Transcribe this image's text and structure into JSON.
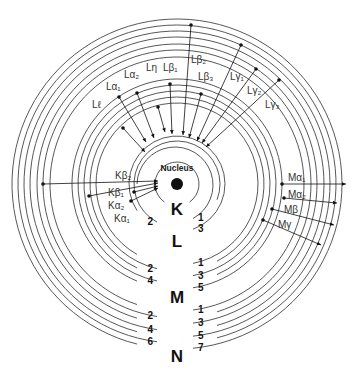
{
  "colors": {
    "line": "#111111",
    "ring": "#444444",
    "background": "#ffffff"
  },
  "center": {
    "x": 177,
    "y": 184
  },
  "nucleus": {
    "label": "Nucleus",
    "radius": 6
  },
  "shells": [
    {
      "name": "K",
      "label_pos": [
        177,
        215
      ],
      "subshells": [
        {
          "n": "",
          "r": 22,
          "side": "both"
        }
      ]
    },
    {
      "name": "L",
      "label_pos": [
        177,
        247
      ],
      "subshells": [
        {
          "n": "1",
          "r": 38,
          "side": "right"
        },
        {
          "n": "2",
          "r": 43,
          "side": "left"
        },
        {
          "n": "3",
          "r": 48,
          "side": "right"
        }
      ]
    },
    {
      "name": "M",
      "label_pos": [
        177,
        303
      ],
      "subshells": [
        {
          "n": "1",
          "r": 81,
          "side": "right"
        },
        {
          "n": "2",
          "r": 87,
          "side": "left"
        },
        {
          "n": "3",
          "r": 93,
          "side": "right"
        },
        {
          "n": "4",
          "r": 99,
          "side": "left"
        },
        {
          "n": "5",
          "r": 105,
          "side": "right"
        }
      ]
    },
    {
      "name": "N",
      "label_pos": [
        177,
        362
      ],
      "subshells": [
        {
          "n": "1",
          "r": 127,
          "side": "right"
        },
        {
          "n": "2",
          "r": 134,
          "side": "left"
        },
        {
          "n": "3",
          "r": 140,
          "side": "right"
        },
        {
          "n": "4",
          "r": 147,
          "side": "left"
        },
        {
          "n": "5",
          "r": 153,
          "side": "right"
        },
        {
          "n": "6",
          "r": 159,
          "side": "left"
        },
        {
          "n": "7",
          "r": 165,
          "side": "right"
        }
      ]
    }
  ],
  "lines": [
    {
      "label": "Lℓ",
      "from": [
        123,
        128
      ],
      "to": [
        145,
        152
      ],
      "label_pos": [
        92,
        108
      ]
    },
    {
      "label": "Lα₁",
      "from": [
        119,
        97
      ],
      "to": [
        146,
        142
      ],
      "label_pos": [
        106,
        90
      ]
    },
    {
      "label": "Lα₂",
      "from": [
        137,
        93
      ],
      "to": [
        154,
        138
      ],
      "label_pos": [
        124,
        78
      ]
    },
    {
      "label": "Lη",
      "from": [
        158,
        107
      ],
      "to": [
        165,
        132
      ],
      "label_pos": [
        146,
        71
      ]
    },
    {
      "label": "Lβ₁",
      "from": [
        170,
        84
      ],
      "to": [
        172,
        134
      ],
      "label_pos": [
        163,
        71
      ]
    },
    {
      "label": "Lβ₂",
      "from": [
        191,
        25
      ],
      "to": [
        183,
        135
      ],
      "label_pos": [
        191,
        63
      ]
    },
    {
      "label": "Lβ₃",
      "from": [
        201,
        94
      ],
      "to": [
        189,
        138
      ],
      "label_pos": [
        198,
        80
      ]
    },
    {
      "label": "Lγ₁",
      "from": [
        241,
        45
      ],
      "to": [
        197,
        141
      ],
      "label_pos": [
        230,
        80
      ]
    },
    {
      "label": "Lγ₂",
      "from": [
        256,
        69
      ],
      "to": [
        202,
        143
      ],
      "label_pos": [
        247,
        94
      ]
    },
    {
      "label": "Lγ₃",
      "from": [
        279,
        80
      ],
      "to": [
        206,
        147
      ],
      "label_pos": [
        265,
        108
      ]
    },
    {
      "label": "Kβ₂",
      "from": [
        43,
        184
      ],
      "to": [
        158,
        181
      ],
      "label_pos": [
        115,
        179
      ]
    },
    {
      "label": "Kβ₁",
      "from": [
        89,
        196
      ],
      "to": [
        158,
        183
      ],
      "label_pos": [
        108,
        196
      ]
    },
    {
      "label": "Kα₂",
      "from": [
        134,
        192
      ],
      "to": [
        158,
        186
      ],
      "label_pos": [
        108,
        209
      ]
    },
    {
      "label": "Kα₁",
      "from": [
        131,
        201
      ],
      "to": [
        158,
        188
      ],
      "label_pos": [
        114,
        222
      ]
    },
    {
      "label": "Mα₁",
      "from": [
        282,
        184
      ],
      "to": [
        346,
        184
      ],
      "label_pos": [
        288,
        181
      ]
    },
    {
      "label": "Mα₂",
      "from": [
        284,
        198
      ],
      "to": [
        337,
        203
      ],
      "label_pos": [
        288,
        198
      ]
    },
    {
      "label": "Mβ",
      "from": [
        272,
        209
      ],
      "to": [
        334,
        225
      ],
      "label_pos": [
        284,
        213
      ]
    },
    {
      "label": "Mγ",
      "from": [
        263,
        220
      ],
      "to": [
        321,
        245
      ],
      "label_pos": [
        278,
        228
      ]
    }
  ]
}
